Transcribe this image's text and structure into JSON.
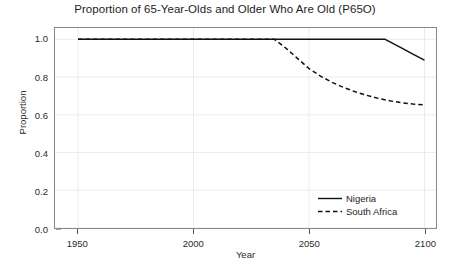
{
  "chart_data": {
    "type": "line",
    "title": "Proportion of 65-Year-Olds and Older Who Are Old (P65O)",
    "xlabel": "Year",
    "ylabel": "Proportion",
    "xlim": [
      1940,
      2105
    ],
    "ylim": [
      0.0,
      1.06
    ],
    "xticks": [
      1950,
      2000,
      2050,
      2100
    ],
    "xtick_labels": [
      "1950",
      "2000",
      "2050",
      "2100"
    ],
    "yticks": [
      0.0,
      0.2,
      0.4,
      0.6,
      0.8,
      1.0
    ],
    "ytick_labels": [
      "0.0",
      "0.2",
      "0.4",
      "0.6",
      "0.8",
      "1.0"
    ],
    "grid": true,
    "legend_position": "lower right",
    "legend_frame": false,
    "series": [
      {
        "name": "Nigeria",
        "style": "solid",
        "color": "#111111",
        "x": [
          1950,
          1960,
          1970,
          1980,
          1990,
          2000,
          2010,
          2020,
          2030,
          2040,
          2050,
          2060,
          2070,
          2080,
          2083,
          2090,
          2095,
          2100
        ],
        "y": [
          1.0,
          1.0,
          1.0,
          1.0,
          1.0,
          1.0,
          1.0,
          1.0,
          1.0,
          1.0,
          1.0,
          1.0,
          1.0,
          1.0,
          1.0,
          0.955,
          0.922,
          0.89
        ]
      },
      {
        "name": "South Africa",
        "style": "dashed",
        "color": "#111111",
        "x": [
          1950,
          1960,
          1970,
          1980,
          1990,
          2000,
          2010,
          2020,
          2030,
          2035,
          2040,
          2045,
          2050,
          2055,
          2060,
          2065,
          2070,
          2075,
          2080,
          2085,
          2090,
          2095,
          2100
        ],
        "y": [
          1.0,
          1.0,
          1.0,
          1.0,
          1.0,
          1.0,
          1.0,
          1.0,
          1.0,
          1.0,
          0.953,
          0.899,
          0.845,
          0.805,
          0.772,
          0.745,
          0.722,
          0.703,
          0.687,
          0.674,
          0.664,
          0.657,
          0.652
        ]
      }
    ]
  },
  "legend": {
    "items": [
      {
        "label": "Nigeria"
      },
      {
        "label": "South Africa"
      }
    ]
  }
}
